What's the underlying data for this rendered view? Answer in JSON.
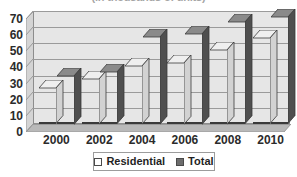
{
  "chart_data": {
    "type": "bar",
    "title": "(in thousands of units)",
    "title_clipped": true,
    "xlabel": "",
    "ylabel": "",
    "categories": [
      "2000",
      "2002",
      "2004",
      "2006",
      "2008",
      "2010"
    ],
    "series": [
      {
        "name": "Residential",
        "color": "#ffffff",
        "values": [
          22,
          28,
          36,
          38,
          46,
          53
        ]
      },
      {
        "name": "Total",
        "color": "#6d6d6d",
        "values": [
          30,
          32,
          54,
          56,
          63,
          66
        ]
      }
    ],
    "ylim": [
      0,
      70
    ],
    "yticks": [
      0,
      10,
      20,
      30,
      40,
      50,
      60,
      70
    ],
    "ytick_labels": [
      "0",
      "10",
      "20",
      "30",
      "40",
      "50",
      "60",
      "70"
    ],
    "grid": true,
    "grid_axis": "y",
    "legend": {
      "position": "bottom",
      "entries": [
        {
          "label": "Residential",
          "swatch": "#ffffff"
        },
        {
          "label": "Total",
          "swatch": "#6d6d6d"
        }
      ]
    },
    "style": {
      "three_d": true,
      "plot_background": "#e6e6e6",
      "axis_color": "#8d8d8d",
      "gridline_color": "#9a9a9a",
      "bar_outline": "#3a3a3a"
    }
  }
}
